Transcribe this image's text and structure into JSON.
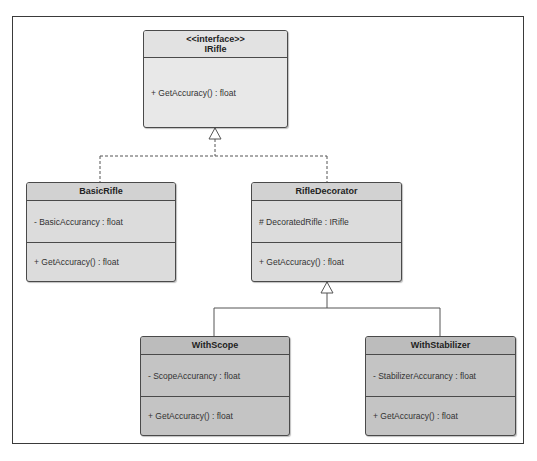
{
  "diagram": {
    "type": "uml-class-diagram",
    "classes": [
      {
        "id": "irifle",
        "stereotype": "<<interface>>",
        "name": "IRifle",
        "attributes": [],
        "methods": [
          "+ GetAccuracy() : float"
        ]
      },
      {
        "id": "basicrifle",
        "name": "BasicRifle",
        "attributes": [
          "- BasicAccurancy : float"
        ],
        "methods": [
          "+ GetAccuracy() : float"
        ]
      },
      {
        "id": "rifledecorator",
        "name": "RifleDecorator",
        "attributes": [
          "# DecoratedRifle : IRifle"
        ],
        "methods": [
          "+ GetAccuracy() : float"
        ]
      },
      {
        "id": "withscope",
        "name": "WithScope",
        "attributes": [
          "- ScopeAccurancy : float"
        ],
        "methods": [
          "+ GetAccuracy() : float"
        ]
      },
      {
        "id": "withstabilizer",
        "name": "WithStabilizer",
        "attributes": [
          "- StabilizerAccurancy : float"
        ],
        "methods": [
          "+ GetAccuracy() : float"
        ]
      }
    ],
    "relationships": [
      {
        "from": "BasicRifle",
        "to": "IRifle",
        "kind": "realization",
        "style": "dashed"
      },
      {
        "from": "RifleDecorator",
        "to": "IRifle",
        "kind": "realization",
        "style": "dashed"
      },
      {
        "from": "WithScope",
        "to": "RifleDecorator",
        "kind": "generalization",
        "style": "solid"
      },
      {
        "from": "WithStabilizer",
        "to": "RifleDecorator",
        "kind": "generalization",
        "style": "solid"
      }
    ],
    "colors": {
      "border": "#4a4a4a",
      "interface_fill": "#e8e8e8",
      "middle_fill": "#dcdcdc",
      "leaf_fill": "#c4c4c4",
      "line": "#555555"
    }
  }
}
